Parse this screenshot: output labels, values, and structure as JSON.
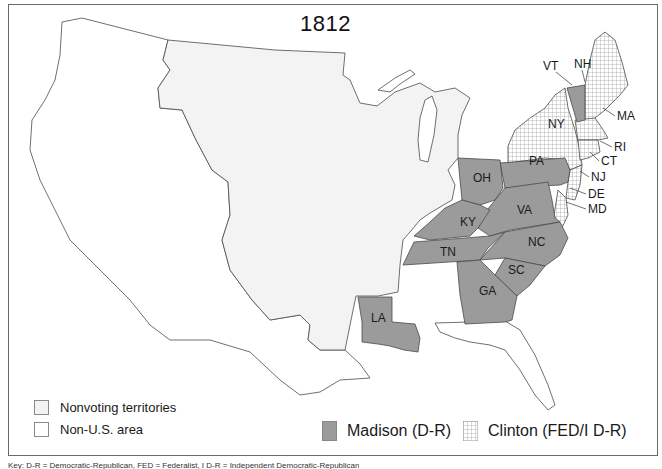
{
  "title": "1812",
  "colors": {
    "madison_fill": "#9b9b9b",
    "clinton_hatch_bg": "#ffffff",
    "clinton_hatch_line": "#9a9a9a",
    "nonvoting_fill": "#f3f3f3",
    "non_us_fill": "#ffffff",
    "border": "#4a4a4a",
    "frame": "#6a6a6a"
  },
  "legend": {
    "nonvoting_label": "Nonvoting territories",
    "non_us_label": "Non-U.S. area",
    "madison_label": "Madison (D-R)",
    "clinton_label": "Clinton (FED/I D-R)"
  },
  "states": {
    "madison": [
      "VT",
      "PA",
      "OH",
      "KY",
      "VA",
      "TN",
      "NC",
      "SC",
      "GA",
      "LA",
      "MD (part)"
    ],
    "clinton": [
      "NH",
      "MA",
      "RI",
      "CT",
      "NY",
      "NJ",
      "DE",
      "MD (part)"
    ]
  },
  "labels": {
    "VT": "VT",
    "NH": "NH",
    "MA": "MA",
    "RI": "RI",
    "CT": "CT",
    "NY": "NY",
    "NJ": "NJ",
    "DE": "DE",
    "MD": "MD",
    "PA": "PA",
    "OH": "OH",
    "VA": "VA",
    "KY": "KY",
    "TN": "TN",
    "NC": "NC",
    "SC": "SC",
    "GA": "GA",
    "LA": "LA"
  },
  "caption": "Key: D-R = Democratic-Republican, FED = Federalist, I D-R = Independent Democratic-Republican"
}
